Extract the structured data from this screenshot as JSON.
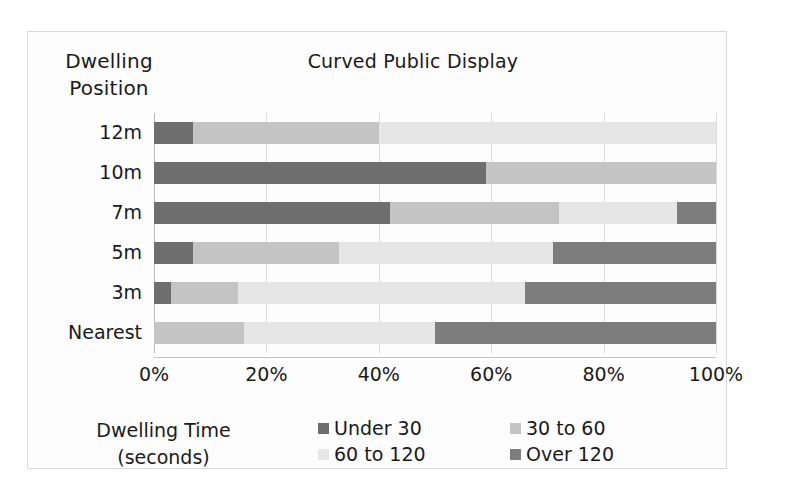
{
  "chart_data": {
    "type": "bar",
    "orientation": "horizontal",
    "stacked": true,
    "normalized": true,
    "title": "Curved Public Display",
    "ylabel": "Dwelling Position",
    "xlabel_lines": [
      "Dwelling Time",
      "(seconds)"
    ],
    "categories": [
      "12m",
      "10m",
      "7m",
      "5m",
      "3m",
      "Nearest"
    ],
    "xticklabels": [
      "0%",
      "20%",
      "40%",
      "60%",
      "80%",
      "100%"
    ],
    "xtick_values": [
      0,
      20,
      40,
      60,
      80,
      100
    ],
    "xlim": [
      0,
      100
    ],
    "grid": true,
    "legend_position": "bottom-right",
    "series": [
      {
        "name": "Under 30",
        "color": "#6e6e6e",
        "values": [
          7,
          59,
          42,
          7,
          3,
          0
        ]
      },
      {
        "name": "30 to 60",
        "color": "#c4c4c4",
        "values": [
          33,
          41,
          30,
          26,
          12,
          16
        ]
      },
      {
        "name": "60 to 120",
        "color": "#e6e6e6",
        "values": [
          60,
          0,
          21,
          38,
          51,
          34
        ]
      },
      {
        "name": "Over 120",
        "color": "#7d7d7d",
        "values": [
          0,
          0,
          7,
          29,
          34,
          50
        ]
      }
    ]
  },
  "legend": {
    "items": [
      {
        "label": "Under 30",
        "color": "#6e6e6e"
      },
      {
        "label": "30 to 60",
        "color": "#c4c4c4"
      },
      {
        "label": "60 to 120",
        "color": "#e6e6e6"
      },
      {
        "label": "Over 120",
        "color": "#7d7d7d"
      }
    ]
  }
}
